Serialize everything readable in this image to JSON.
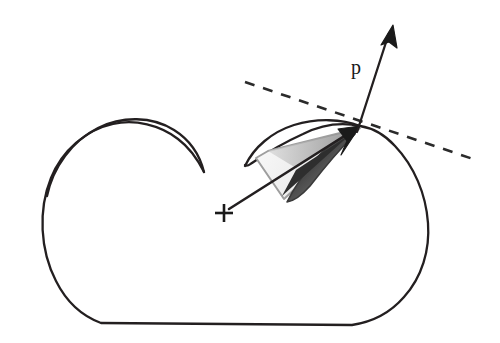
{
  "figure": {
    "kind": "geometric-diagram",
    "title": "",
    "background_color": "#ffffff",
    "stroke_color": "#231f20",
    "dashed_color": "#2b2b2b",
    "cone_outline_color": "#9a9a9a",
    "cone_fill_light": "#f2f2f2",
    "lens_fill_dark": "#555555",
    "labels": [
      {
        "id": "vector-p",
        "text": "p",
        "x": 356,
        "y": 74
      }
    ],
    "markers": [
      {
        "id": "origin-cross",
        "symbol": "plus",
        "x": 224,
        "y": 213,
        "size": 9
      }
    ],
    "points": [
      {
        "id": "contact-point",
        "x": 360,
        "y": 126
      },
      {
        "id": "p-arrow-tip",
        "x": 393,
        "y": 25
      },
      {
        "id": "tangent-left-end",
        "x": 245,
        "y": 82
      },
      {
        "id": "tangent-right-end",
        "x": 479,
        "y": 161
      }
    ],
    "body_outline_description": "closed bean/kidney-shaped convex-ish region with an inward spiral notch at the upper left",
    "dash_pattern": "10 9"
  }
}
